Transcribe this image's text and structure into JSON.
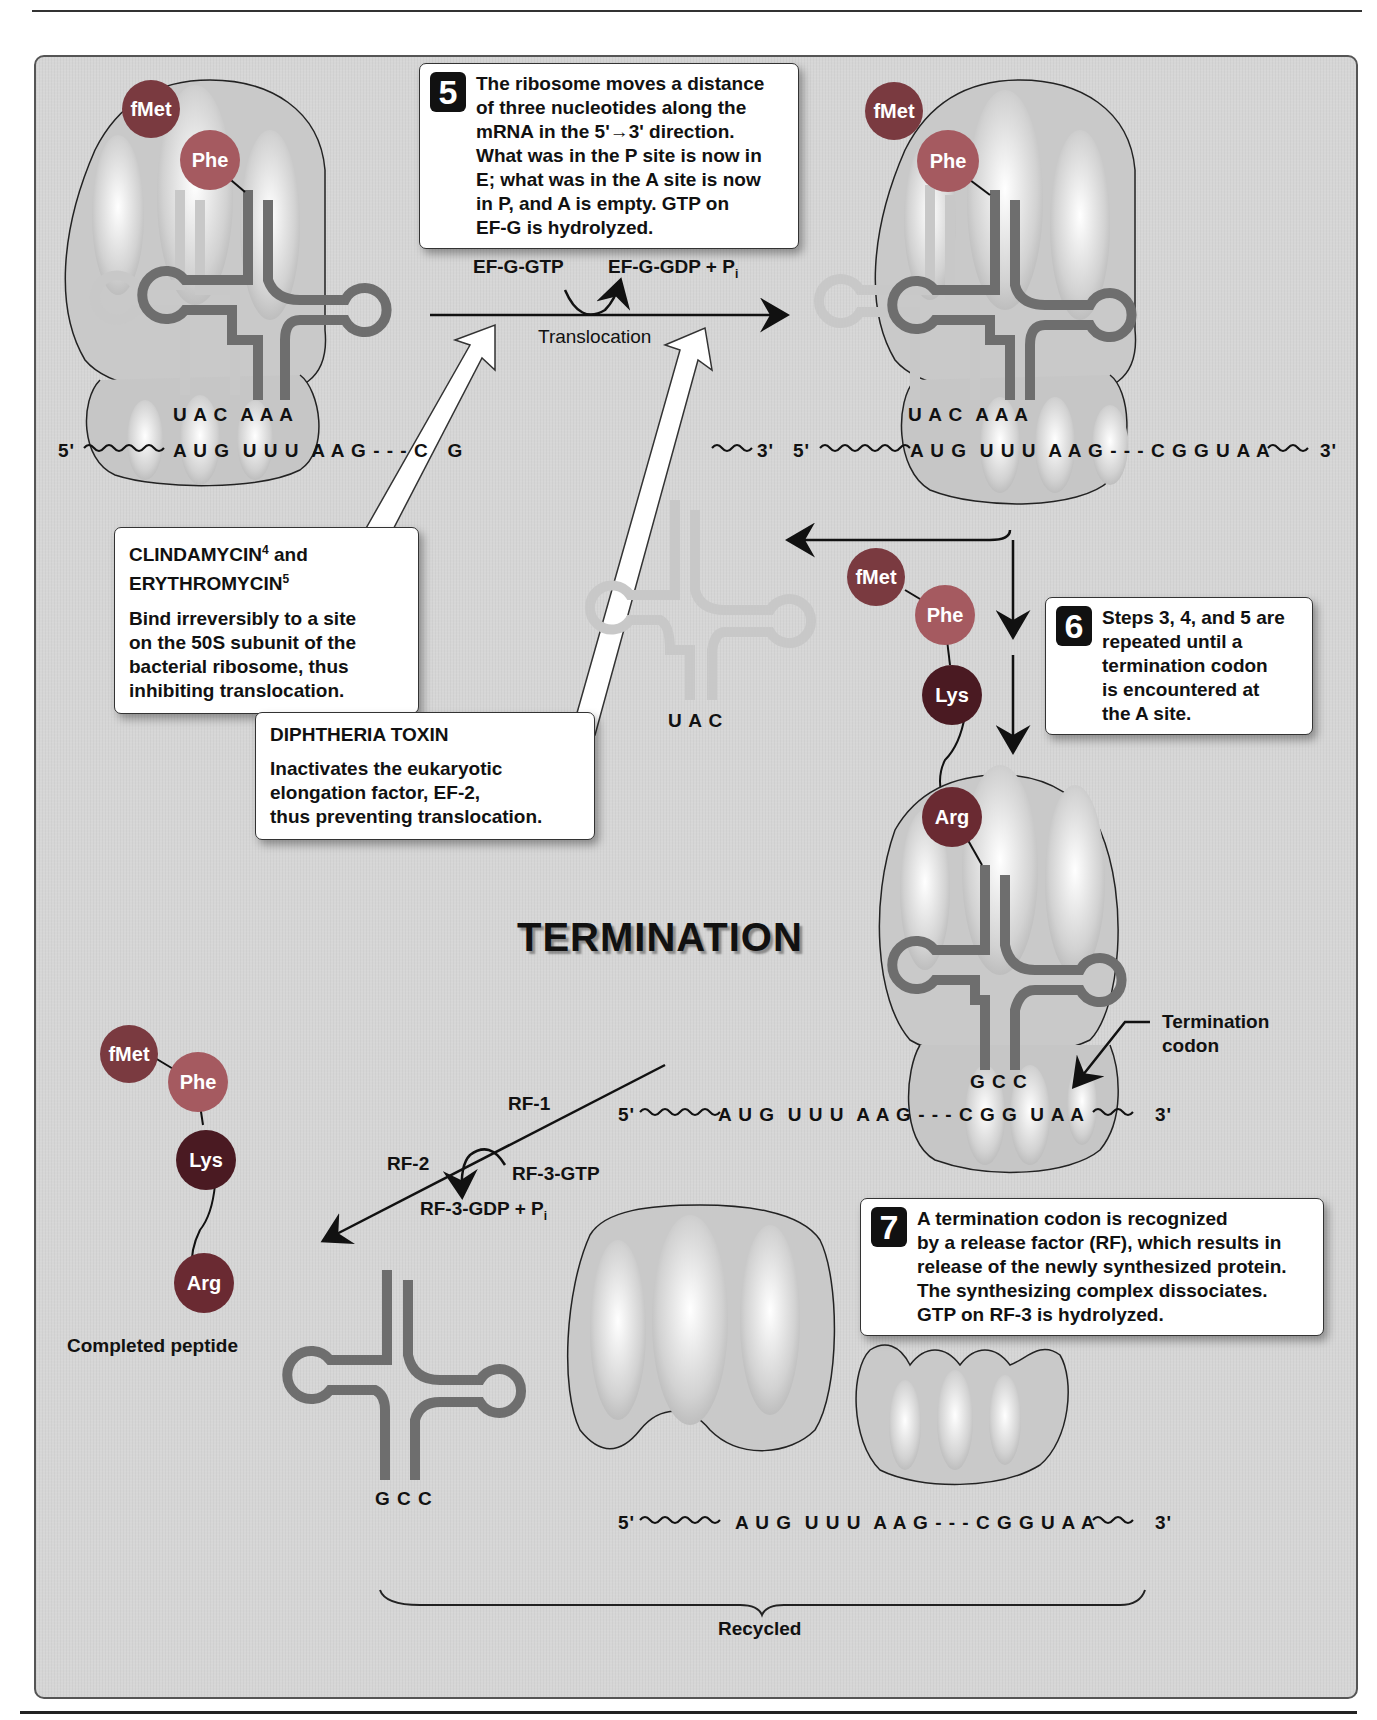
{
  "page": {
    "section_title": "TERMINATION"
  },
  "step5": {
    "number": "5",
    "text": "The ribosome moves a distance\nof three nucleotides along the\nmRNA in the 5'→3'  direction.\nWhat was in the P site is now in\nE; what was in the A site is now\nin P, and A is empty. GTP on\nEF-G is hydrolyzed."
  },
  "translocation": {
    "reactant": "EF-G-GTP",
    "product": "EF-G-GDP + P",
    "product_sub": "i",
    "label": "Translocation"
  },
  "drugs": {
    "clindamycin": {
      "title_line1": "CLINDAMYCIN",
      "title_sup1": "4",
      "title_and": " and",
      "title_line2": "ERYTHROMYCIN",
      "title_sup2": "5",
      "description": "Bind irreversibly to a site\non the 50S subunit of the\nbacterial ribosome, thus\ninhibiting translocation."
    },
    "diphtheria": {
      "title": "DIPHTHERIA TOXIN",
      "description": "Inactivates the eukaryotic\nelongation factor, EF-2,\nthus preventing translocation."
    }
  },
  "step6": {
    "number": "6",
    "text": "Steps 3, 4, and 5 are\nrepeated until a\ntermination codon\nis encountered at\nthe A site."
  },
  "step7": {
    "number": "7",
    "text": "A termination codon is recognized\nby a release factor (RF), which results in\nrelease of the newly synthesized protein.\nThe synthesizing complex dissociates.\nGTP on RF-3 is hydrolyzed."
  },
  "release_factors": {
    "rf1": "RF-1",
    "rf2": "RF-2",
    "rf3_gtp": "RF-3-GTP",
    "rf3_gdp": "RF-3-GDP + P",
    "rf3_gdp_sub": "i"
  },
  "labels": {
    "termination_codon": "Termination\ncodon",
    "completed_peptide": "Completed peptide",
    "recycled": "Recycled"
  },
  "amino_acids": {
    "fmet": "fMet",
    "phe": "Phe",
    "lys": "Lys",
    "arg": "Arg"
  },
  "sequences": {
    "top_left_anticodons": "U A C  A A A",
    "top_left_mrna_5": "5'",
    "top_left_mrna": "A U G  U U U  A A G - - - C   G",
    "top_right_3end": "3'",
    "top_right_anticodons": "U A C  A A A",
    "top_right_mrna_5": "5'",
    "top_right_mrna": "A U G  U U U  A A G - - - C G G U A A",
    "top_right_mrna_3": "3'",
    "free_trna_anticodon": "U A C",
    "term_anticodon": "G C C",
    "term_mrna_5": "5'",
    "term_mrna": "A U G  U U U  A A G - - - C G G  U A A",
    "term_mrna_3": "3'",
    "released_trna_anticodon": "G C C",
    "recycled_mrna_5": "5'",
    "recycled_mrna": "A U G  U U U  A A G - - - C G G U A A",
    "recycled_mrna_3": "3'"
  },
  "colors": {
    "panel_background": "#d6d6d6",
    "trna_dark": "#6e6e6e",
    "trna_light": "#c8c8c8",
    "fmet": "#7a3a40",
    "phe": "#a55a60",
    "lys": "#4a1a22",
    "arg": "#6a2a32",
    "step_badge": "#111111"
  }
}
